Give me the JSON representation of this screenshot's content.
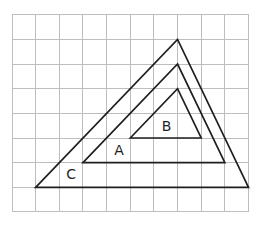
{
  "diagram": {
    "grid": {
      "columns": 10,
      "rows": 8
    },
    "triangles": [
      {
        "id": "C",
        "label": "C",
        "vertices": [
          [
            1,
            7
          ],
          [
            7,
            1
          ],
          [
            10,
            7
          ]
        ],
        "label_at": [
          2.5,
          6.45
        ]
      },
      {
        "id": "A",
        "label": "A",
        "vertices": [
          [
            3,
            6
          ],
          [
            7,
            2
          ],
          [
            9,
            6
          ]
        ],
        "label_at": [
          4.53,
          5.5
        ]
      },
      {
        "id": "B",
        "label": "B",
        "vertices": [
          [
            5,
            5
          ],
          [
            7,
            3
          ],
          [
            8,
            5
          ]
        ],
        "label_at": [
          6.54,
          4.5
        ]
      }
    ]
  }
}
